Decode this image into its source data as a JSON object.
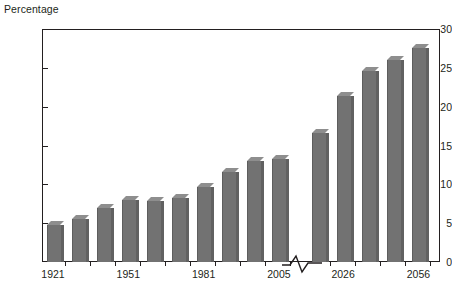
{
  "chart_data": {
    "type": "bar",
    "title": "",
    "ylabel": "Percentage",
    "xlabel": "",
    "ylim": [
      0,
      30
    ],
    "ytick_labels": [
      "0",
      "5",
      "10",
      "15",
      "20",
      "25",
      "30"
    ],
    "ytick_values": [
      0,
      5,
      10,
      15,
      20,
      25,
      30
    ],
    "grid": false,
    "legend": "none",
    "axis_break": {
      "present": true,
      "between_categories": [
        "2005",
        "2011"
      ],
      "symbol": "zigzag"
    },
    "categories": [
      "1921",
      "1931",
      "1941",
      "1951",
      "1961",
      "1971",
      "1981",
      "1991",
      "2001",
      "2005",
      "2011",
      "2026",
      "2036",
      "2046",
      "2056"
    ],
    "values": [
      4.8,
      5.6,
      7.0,
      8.0,
      7.8,
      8.2,
      9.6,
      11.6,
      13.0,
      13.2,
      16.6,
      21.4,
      24.6,
      26.0,
      27.5
    ],
    "xtick_labels_shown": [
      "1921",
      "1951",
      "1981",
      "2005",
      "2026",
      "2056"
    ],
    "xtick_label_indices": [
      0,
      3,
      6,
      9,
      11,
      14
    ],
    "bar_color": "#727272",
    "bar_top_color": "#8e8e8e",
    "bar_side_color": "#616161",
    "axis_color": "#231f20",
    "background_color": "#ffffff"
  }
}
